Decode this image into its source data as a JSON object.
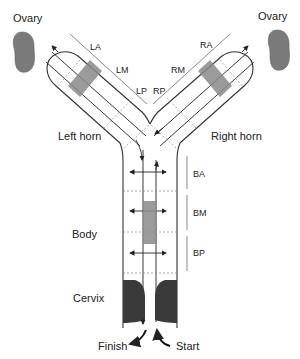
{
  "labels": {
    "ovary_left": "Ovary",
    "ovary_right": "Ovary",
    "left_horn": "Left horn",
    "right_horn": "Right horn",
    "body": "Body",
    "cervix": "Cervix",
    "finish": "Finish",
    "start": "Start"
  },
  "segments": {
    "left": [
      "LA",
      "LM",
      "LP"
    ],
    "right": [
      "RA",
      "RM",
      "RP"
    ],
    "body": [
      "BA",
      "BM",
      "BP"
    ]
  },
  "colors": {
    "ovary": "#7a7a7a",
    "shade": "#8a8a8a",
    "cervix": "#3a3a3a",
    "line": "#222222"
  }
}
